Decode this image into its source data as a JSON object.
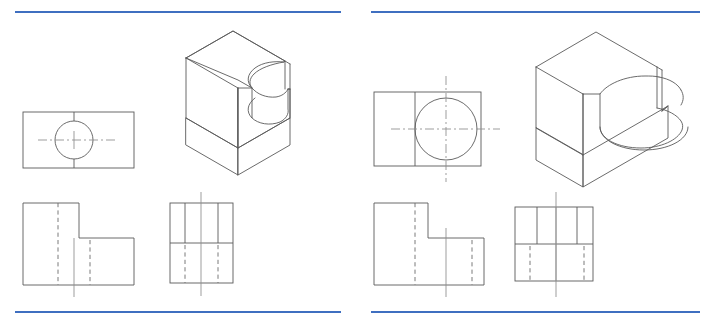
{
  "page": {
    "width": 711,
    "height": 323,
    "background_color": "#ffffff",
    "rule_color": "#3f6fc0",
    "line_color": "#5a5a5a",
    "hidden_line_color": "#6b6b6b",
    "center_line_color": "#8c8c8c"
  },
  "rules": {
    "top_left": {
      "x1": 15,
      "y1": 12,
      "x2": 341,
      "y2": 12
    },
    "top_right": {
      "x1": 371,
      "y1": 12,
      "x2": 700,
      "y2": 12
    },
    "bottom_left": {
      "x1": 15,
      "y1": 312,
      "x2": 341,
      "y2": 312
    },
    "bottom_right": {
      "x1": 371,
      "y1": 312,
      "x2": 700,
      "y2": 312
    }
  },
  "figures": [
    {
      "id": "left-figure",
      "name": "Problem 1 - L-block with through cylindrical slot (small bore)",
      "views": {
        "top_view": {
          "name": "top-view",
          "rect": {
            "x": 23,
            "y": 112,
            "width": 111,
            "height": 56
          },
          "circle": {
            "cx": 74,
            "cy": 140,
            "r": 19
          },
          "vertical_tangent_lines": [
            74
          ],
          "horizontal_centerline": {
            "x1": 38,
            "y1": 140,
            "x2": 118,
            "y2": 140
          },
          "vertical_centerline": {
            "x1": 74,
            "y1": 112,
            "x2": 74,
            "y2": 168
          }
        },
        "front_view": {
          "name": "front-view",
          "outline": [
            [
              23,
              203
            ],
            [
              79,
              203
            ],
            [
              79,
              238
            ],
            [
              134,
              238
            ],
            [
              134,
              285
            ],
            [
              23,
              285
            ]
          ],
          "hidden_lines": [
            {
              "x1": 58,
              "y1": 203,
              "x2": 58,
              "y2": 285
            },
            {
              "x1": 90,
              "y1": 238,
              "x2": 90,
              "y2": 285
            }
          ],
          "centerline": {
            "x1": 74,
            "y1": 238,
            "x2": 74,
            "y2": 297
          }
        },
        "side_view": {
          "name": "side-view",
          "rect": {
            "x": 170,
            "y": 203,
            "width": 63,
            "height": 80
          },
          "horizontal_divider": {
            "y": 243
          },
          "solid_verticals": [
            185,
            218
          ],
          "hidden_verticals": [
            185,
            218
          ],
          "centerline": {
            "x1": 201,
            "y1": 192,
            "x2": 201,
            "y2": 296
          }
        },
        "isometric": {
          "name": "isometric-view",
          "description": "L-shaped block, vertical back wall, horizontal base, semicircular slot cut through the step"
        }
      }
    },
    {
      "id": "right-figure",
      "name": "Problem 2 - L-block with large cylindrical pocket in base",
      "views": {
        "top_view": {
          "name": "top-view",
          "rect": {
            "x": 374,
            "y": 92,
            "width": 107,
            "height": 74
          },
          "circle": {
            "cx": 446,
            "cy": 129,
            "r": 31
          },
          "vertical_tangent_lines": [
            415
          ],
          "horizontal_centerline": {
            "x1": 391,
            "y1": 129,
            "x2": 500,
            "y2": 129
          },
          "vertical_centerline": {
            "x1": 446,
            "y1": 76,
            "x2": 446,
            "y2": 182
          }
        },
        "front_view": {
          "name": "front-view",
          "outline": [
            [
              374,
              203
            ],
            [
              428,
              203
            ],
            [
              428,
              238
            ],
            [
              484,
              238
            ],
            [
              484,
              285
            ],
            [
              374,
              285
            ]
          ],
          "hidden_lines": [
            {
              "x1": 415,
              "y1": 203,
              "x2": 415,
              "y2": 285
            },
            {
              "x1": 472,
              "y1": 238,
              "x2": 472,
              "y2": 285
            }
          ],
          "centerline": {
            "x1": 446,
            "y1": 228,
            "x2": 446,
            "y2": 297
          }
        },
        "side_view": {
          "name": "side-view",
          "rect": {
            "x": 515,
            "y": 207,
            "width": 78,
            "height": 74
          },
          "horizontal_divider": {
            "y": 244
          },
          "solid_verticals": [
            537,
            577
          ],
          "hidden_verticals": [
            530,
            584
          ],
          "centerline": {
            "x1": 556,
            "y1": 192,
            "x2": 556,
            "y2": 297
          }
        },
        "isometric": {
          "name": "isometric-view",
          "description": "L-shaped block, vertical back wall, horizontal base, large round-ended pocket cut into the base top face"
        }
      }
    }
  ]
}
